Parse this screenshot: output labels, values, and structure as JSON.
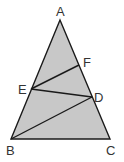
{
  "diagram": {
    "type": "triangle",
    "fill": "#c8c8c8",
    "stroke": "#1a1a1a",
    "points": {
      "A": {
        "label": "A",
        "x": 60,
        "y": 20
      },
      "B": {
        "label": "B",
        "x": 11,
        "y": 139
      },
      "C": {
        "label": "C",
        "x": 110,
        "y": 139
      },
      "D": {
        "label": "D",
        "x": 92,
        "y": 97
      },
      "E": {
        "label": "E",
        "x": 31,
        "y": 89
      },
      "F": {
        "label": "F",
        "x": 79,
        "y": 65
      }
    },
    "segments": [
      "AB",
      "BC",
      "CA",
      "EF",
      "ED",
      "BD"
    ]
  }
}
